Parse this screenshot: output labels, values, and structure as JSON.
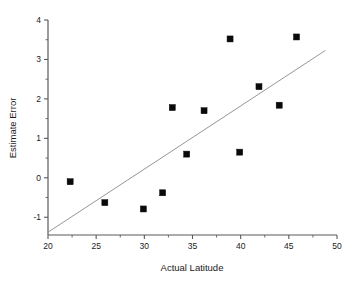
{
  "chart_data": {
    "type": "scatter",
    "title": "",
    "xlabel": "Actual Latitude",
    "ylabel": "Estimate Error",
    "xlim": [
      20,
      50
    ],
    "ylim": [
      -1.45,
      4
    ],
    "grid": false,
    "legend": null,
    "x_ticks": [
      20,
      25,
      30,
      35,
      40,
      45,
      50
    ],
    "x_tick_labels": [
      "20",
      "25",
      "30",
      "35",
      "40",
      "45",
      "50"
    ],
    "x_minor_step": 2.5,
    "y_ticks": [
      -1,
      0,
      1,
      2,
      3,
      4
    ],
    "y_tick_labels": [
      "-1",
      "0",
      "1",
      "2",
      "3",
      "4"
    ],
    "y_minor_step": 0.5,
    "points": [
      {
        "x": 22.3,
        "y": -0.1
      },
      {
        "x": 25.9,
        "y": -0.63
      },
      {
        "x": 29.9,
        "y": -0.79
      },
      {
        "x": 31.9,
        "y": -0.38
      },
      {
        "x": 32.9,
        "y": 1.78
      },
      {
        "x": 34.4,
        "y": 0.6
      },
      {
        "x": 36.2,
        "y": 1.7
      },
      {
        "x": 38.9,
        "y": 3.52
      },
      {
        "x": 39.9,
        "y": 0.65
      },
      {
        "x": 41.9,
        "y": 2.31
      },
      {
        "x": 44.0,
        "y": 1.84
      },
      {
        "x": 45.8,
        "y": 3.57
      }
    ],
    "fit_line": {
      "type": "linear",
      "x_start": 20.0,
      "y_start": -1.38,
      "x_end": 48.8,
      "y_end": 3.23
    },
    "marker_style": "filled-square",
    "marker_size_px": 6,
    "colors": {
      "marker": "#0a0a0a",
      "fit_line": "#8a8a8a",
      "axis": "#5a5a5a",
      "text": "#1a1a1a",
      "background": "#ffffff"
    }
  }
}
